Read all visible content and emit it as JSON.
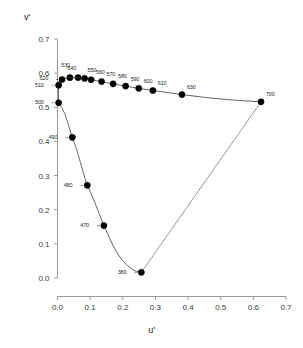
{
  "chart_data": {
    "type": "scatter",
    "title": "",
    "subtitle": "",
    "xlabel": "u'",
    "ylabel": "v'",
    "xlim": [
      0.0,
      0.7
    ],
    "ylim": [
      0.0,
      0.7
    ],
    "grid": false,
    "legend": "none",
    "xticks": [
      "0.0",
      "0.1",
      "0.2",
      "0.3",
      "0.4",
      "0.5",
      "0.6",
      "0.7"
    ],
    "xtick_values": [
      0.0,
      0.1,
      0.2,
      0.3,
      0.4,
      0.5,
      0.6,
      0.7
    ],
    "yticks": [
      "0.0",
      "0.1",
      "0.2",
      "0.3",
      "0.4",
      "0.5",
      "0.6",
      "0.7"
    ],
    "ytick_values": [
      0.0,
      0.1,
      0.2,
      0.3,
      0.4,
      0.5,
      0.6,
      0.7
    ],
    "series": [
      {
        "name": "spectral locus",
        "marker": "filled-circle",
        "marker_color": "#000000",
        "line_color": "#555555",
        "points": [
          {
            "label": "380",
            "x": 0.2568,
            "y": 0.0165,
            "label_dx": -17,
            "label_dy": 0
          },
          {
            "label": "470",
            "x": 0.1421,
            "y": 0.1535,
            "label_dx": -17,
            "label_dy": 0
          },
          {
            "label": "480",
            "x": 0.0913,
            "y": 0.2713,
            "label_dx": -17,
            "label_dy": 0
          },
          {
            "label": "490",
            "x": 0.0454,
            "y": 0.4119,
            "label_dx": -17,
            "label_dy": 0
          },
          {
            "label": "500",
            "x": 0.0035,
            "y": 0.5131,
            "label_dx": -17,
            "label_dy": 0
          },
          {
            "label": "510",
            "x": 0.0035,
            "y": 0.5647,
            "label_dx": -17,
            "label_dy": 0
          },
          {
            "label": "520",
            "x": 0.0139,
            "y": 0.5814,
            "label_dx": -16,
            "label_dy": -1
          },
          {
            "label": "530",
            "x": 0.038,
            "y": 0.5868,
            "label_dx": -2,
            "label_dy": -12
          },
          {
            "label": "540",
            "x": 0.063,
            "y": 0.5869,
            "label_dx": -4,
            "label_dy": -9
          },
          {
            "label": "550",
            "x": 0.0829,
            "y": 0.5846,
            "label_dx": 3,
            "label_dy": -8
          },
          {
            "label": "560",
            "x": 0.1029,
            "y": 0.5807,
            "label_dx": 5,
            "label_dy": -7
          },
          {
            "label": "570",
            "x": 0.135,
            "y": 0.5752,
            "label_dx": 5,
            "label_dy": -7
          },
          {
            "label": "580",
            "x": 0.1704,
            "y": 0.5686,
            "label_dx": 5,
            "label_dy": -7
          },
          {
            "label": "590",
            "x": 0.2087,
            "y": 0.562,
            "label_dx": 5,
            "label_dy": -7
          },
          {
            "label": "600",
            "x": 0.2489,
            "y": 0.5556,
            "label_dx": 5,
            "label_dy": -7
          },
          {
            "label": "610",
            "x": 0.2921,
            "y": 0.5492,
            "label_dx": 5,
            "label_dy": -7
          },
          {
            "label": "630",
            "x": 0.3813,
            "y": 0.5372,
            "label_dx": 5,
            "label_dy": -7
          },
          {
            "label": "700",
            "x": 0.6234,
            "y": 0.516,
            "label_dx": 5,
            "label_dy": -7
          }
        ]
      }
    ],
    "locus_curve": [
      [
        0.2568,
        0.0165
      ],
      [
        0.25,
        0.0175
      ],
      [
        0.2411,
        0.0195
      ],
      [
        0.23,
        0.025
      ],
      [
        0.215,
        0.036
      ],
      [
        0.199,
        0.051
      ],
      [
        0.185,
        0.07
      ],
      [
        0.17,
        0.095
      ],
      [
        0.156,
        0.125
      ],
      [
        0.1421,
        0.1535
      ],
      [
        0.13,
        0.182
      ],
      [
        0.118,
        0.212
      ],
      [
        0.105,
        0.243
      ],
      [
        0.0913,
        0.2713
      ],
      [
        0.08,
        0.305
      ],
      [
        0.069,
        0.342
      ],
      [
        0.058,
        0.379
      ],
      [
        0.0454,
        0.4119
      ],
      [
        0.034,
        0.447
      ],
      [
        0.023,
        0.48
      ],
      [
        0.013,
        0.499
      ],
      [
        0.006,
        0.508
      ],
      [
        0.0035,
        0.5131
      ],
      [
        0.0025,
        0.53
      ],
      [
        0.003,
        0.548
      ],
      [
        0.0035,
        0.5647
      ],
      [
        0.007,
        0.576
      ],
      [
        0.0139,
        0.5814
      ],
      [
        0.025,
        0.585
      ],
      [
        0.038,
        0.5868
      ],
      [
        0.051,
        0.5872
      ],
      [
        0.063,
        0.5869
      ],
      [
        0.0829,
        0.5846
      ],
      [
        0.1029,
        0.5807
      ],
      [
        0.135,
        0.5752
      ],
      [
        0.1704,
        0.5686
      ],
      [
        0.2087,
        0.562
      ],
      [
        0.2489,
        0.5556
      ],
      [
        0.2921,
        0.5492
      ],
      [
        0.338,
        0.543
      ],
      [
        0.3813,
        0.5372
      ],
      [
        0.46,
        0.528
      ],
      [
        0.54,
        0.521
      ],
      [
        0.6234,
        0.516
      ]
    ],
    "purple_line": [
      [
        0.6234,
        0.516
      ],
      [
        0.2568,
        0.0165
      ]
    ],
    "annotations": {
      "description": "CIE 1976 UCS chromaticity diagram spectral locus with wavelength labels in nanometres"
    },
    "colors": {
      "marker": "#000000",
      "locus_line": "#555555",
      "purple_line": "#8a8a8a",
      "axis": "#9a9a9a",
      "text": "#1a1a1a"
    }
  }
}
